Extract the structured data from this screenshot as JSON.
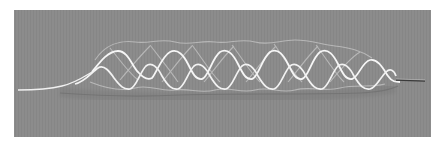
{
  "image": {
    "subject": "braided wire stent photograph",
    "alt": "Sinusoidal nitinol wire stent on gray background",
    "colors": {
      "background_border": "#ffffff",
      "panel": "#8c8c8c",
      "panel_stripe": "#858585",
      "wire_bright": "#f4f4f4",
      "wire_faint": "#c9c9c9",
      "wire_shadow": "#6e6e6e",
      "tail_dark": "#3a3a3a"
    }
  }
}
